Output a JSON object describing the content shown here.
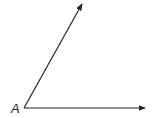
{
  "diagram": {
    "type": "angle",
    "vertex": {
      "label": "A",
      "x": 24,
      "y": 108
    },
    "rays": [
      {
        "name": "upper-ray",
        "from": [
          24,
          108
        ],
        "to": [
          82,
          4
        ]
      },
      {
        "name": "horizontal-ray",
        "from": [
          24,
          108
        ],
        "to": [
          145,
          108
        ]
      }
    ],
    "stroke_color": "#222222"
  }
}
